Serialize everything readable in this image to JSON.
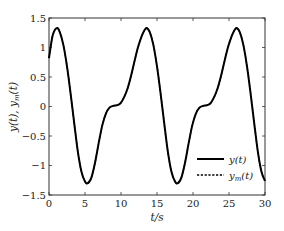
{
  "chart_data": {
    "type": "line",
    "title": "",
    "xlabel": "t/s",
    "ylabel": "y(t), y_m(t)",
    "xlim": [
      0,
      30
    ],
    "ylim": [
      -1.5,
      1.5
    ],
    "xticks": [
      0,
      5,
      10,
      15,
      20,
      25,
      30
    ],
    "yticks": [
      -1.5,
      -1,
      -0.5,
      0,
      0.5,
      1,
      1.5
    ],
    "xtick_labels": [
      "0",
      "5",
      "10",
      "15",
      "20",
      "25",
      "30"
    ],
    "ytick_labels": [
      "−1.5",
      "−1",
      "−0.5",
      "0",
      "0.5",
      "1",
      "1.5"
    ],
    "grid": false,
    "legend_position": "lower right",
    "series": [
      {
        "name": "y(t)",
        "style": "solid",
        "color": "#000000",
        "x": [
          0,
          0.5,
          1.07,
          1.5,
          2,
          2.5,
          3,
          3.5,
          4,
          4.5,
          5,
          5.4,
          5.9,
          6.4,
          6.9,
          7.4,
          7.9,
          8.4,
          8.9,
          9.4,
          9.9,
          10.4,
          10.9,
          11.4,
          11.9,
          12.4,
          12.9,
          13.3,
          13.57,
          14,
          14.5,
          15,
          15.5,
          16,
          16.5,
          17,
          17.5,
          17.9,
          18.4,
          18.9,
          19.4,
          19.9,
          20.4,
          20.9,
          21.4,
          21.9,
          22.4,
          22.9,
          23.4,
          23.9,
          24.4,
          24.9,
          25.4,
          25.8,
          26.07,
          26.5,
          27,
          27.5,
          28,
          28.5,
          29,
          29.5,
          30
        ],
        "y": [
          0.82,
          1.2,
          1.33,
          1.26,
          1.04,
          0.68,
          0.22,
          -0.28,
          -0.76,
          -1.1,
          -1.27,
          -1.3,
          -1.2,
          -0.95,
          -0.62,
          -0.32,
          -0.12,
          -0.02,
          0.01,
          0.02,
          0.05,
          0.15,
          0.3,
          0.52,
          0.78,
          1.02,
          1.2,
          1.3,
          1.33,
          1.26,
          1.04,
          0.68,
          0.22,
          -0.28,
          -0.76,
          -1.1,
          -1.27,
          -1.3,
          -1.2,
          -0.95,
          -0.62,
          -0.32,
          -0.12,
          -0.02,
          0.01,
          0.02,
          0.05,
          0.15,
          0.3,
          0.52,
          0.78,
          1.02,
          1.2,
          1.3,
          1.33,
          1.26,
          1.04,
          0.68,
          0.22,
          -0.28,
          -0.76,
          -1.1,
          -1.26
        ]
      },
      {
        "name": "y_m(t)",
        "style": "dashed",
        "color": "#000000",
        "overlaps": "y(t)"
      }
    ]
  },
  "legend": {
    "items": [
      {
        "label_main": "y(t)",
        "label_sub": "",
        "style": "solid"
      },
      {
        "label_main": "y",
        "label_sub": "m",
        "label_tail": "(t)",
        "style": "dashed"
      }
    ]
  },
  "labels": {
    "xlabel": "t/s",
    "ylabel_main_1": "y(t), y",
    "ylabel_sub": "m",
    "ylabel_tail": "(t)"
  }
}
